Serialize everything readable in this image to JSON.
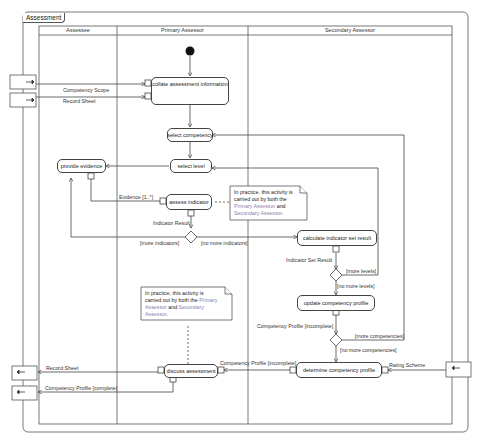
{
  "frame": {
    "title": "Assessment"
  },
  "lanes": [
    {
      "label": "Assessee"
    },
    {
      "label": "Primary Assessor"
    },
    {
      "label": "Secondary Assessor"
    }
  ],
  "actions": {
    "collate": "collate assessment information",
    "select_competency": "select competency",
    "select_level": "select level",
    "provide_evidence": "provide evidence",
    "assess_indicator": "assess indicator",
    "calculate": "calculate indicator set result",
    "update_profile": "update competency profile",
    "determine_profile": "determine competency profile",
    "discuss": "discuss assessment"
  },
  "flows": {
    "competency_scope": "Competency Scope",
    "record_sheet_in": "Record Sheet",
    "evidence": "Evidence [1..*]",
    "indicator_result": "Indicator Result",
    "more_indicators": "[more indicators]",
    "no_more_indicators": "[no more indicators]",
    "indicator_set_result": "Indicator Set Result",
    "more_levels": "[more levels]",
    "no_more_levels": "[no more levels]",
    "profile_incomplete": "Competency Profile [incomplete]",
    "more_competencies": "[more competencies]",
    "no_more_competencies": "[no more competencies]",
    "profile_incomplete_2": "Competency Profile [incomplete]",
    "rating_scheme": "Rating Scheme",
    "record_sheet_out": "Record Sheet",
    "profile_complete": "Competency Profile [complete]"
  },
  "notes": {
    "note1": {
      "pre": "In practice, this activity is carried out by both the ",
      "r1": "Primary Assessor",
      "mid": " and ",
      "r2": "Secondary Assessor",
      "post": "."
    },
    "note2": {
      "pre": "In practice, this activity is carried out by both the ",
      "r1": "Primary Assessor",
      "mid": " and ",
      "r2": "Secondary Assessor",
      "post": "."
    }
  },
  "colors": {
    "line": "#444444",
    "role_highlight": "#8a7fb0"
  }
}
